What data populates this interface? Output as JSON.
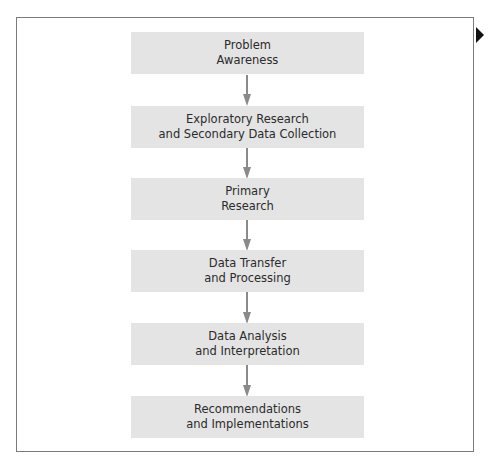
{
  "diagram": {
    "type": "flowchart",
    "direction": "top-to-bottom",
    "colors": {
      "box_fill": "#e4e4e4",
      "text": "#2b2b2b",
      "arrow": "#8a8a8a",
      "frame": "#7a7a7a",
      "marker": "#111111"
    },
    "steps": [
      {
        "line1": "Problem",
        "line2": "Awareness"
      },
      {
        "line1": "Exploratory Research",
        "line2": "and Secondary Data Collection"
      },
      {
        "line1": "Primary",
        "line2": "Research"
      },
      {
        "line1": "Data Transfer",
        "line2": "and Processing"
      },
      {
        "line1": "Data Analysis",
        "line2": "and Interpretation"
      },
      {
        "line1": "Recommendations",
        "line2": "and Implementations"
      }
    ]
  }
}
